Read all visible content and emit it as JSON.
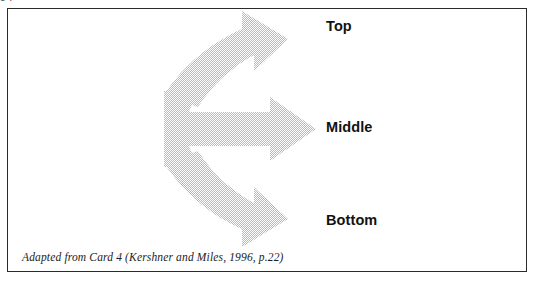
{
  "page": {
    "clipped_text_above": "g           p"
  },
  "figure": {
    "caption": "Adapted from Card 4 (Kershner and Miles, 1996, p.22)",
    "border_color": "#2b2b2b",
    "background_color": "#ffffff"
  },
  "diagram": {
    "type": "branching-arrow",
    "fill_color": "#d8d8d8",
    "fill_style": "dithered-halftone-gray",
    "branches": [
      {
        "id": "top",
        "label": "Top",
        "direction": "up-right"
      },
      {
        "id": "middle",
        "label": "Middle",
        "direction": "right"
      },
      {
        "id": "bottom",
        "label": "Bottom",
        "direction": "down-right"
      }
    ]
  },
  "labels": {
    "top": "Top",
    "middle": "Middle",
    "bottom": "Bottom"
  }
}
